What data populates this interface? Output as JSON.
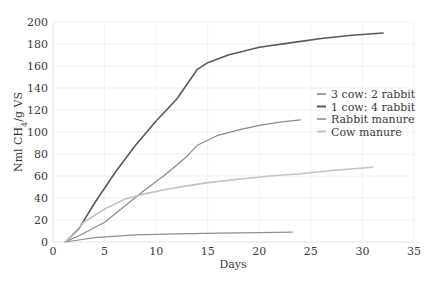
{
  "chart_data": {
    "type": "line",
    "title": "",
    "xlabel": "Days",
    "ylabel": "Nml CH4/g VS",
    "ylabel_parts": {
      "base": "Nml CH",
      "sub": "4",
      "rest": "/g VS"
    },
    "xlim": [
      0,
      35
    ],
    "ylim": [
      0,
      200
    ],
    "xticks": [
      0,
      5,
      10,
      15,
      20,
      25,
      30,
      35
    ],
    "yticks": [
      0,
      20,
      40,
      60,
      80,
      100,
      120,
      140,
      160,
      180,
      200
    ],
    "grid": true,
    "legend_position": "right-middle",
    "series": [
      {
        "name": "3 cow: 2 rabbit",
        "color": "#8a8a8a",
        "width": 1.2,
        "x": [
          1.2,
          3,
          5,
          7,
          9,
          11,
          13,
          14,
          16,
          18,
          20,
          22,
          24
        ],
        "y": [
          0,
          8,
          18,
          33,
          48,
          62,
          78,
          88,
          97,
          102,
          106,
          109,
          111
        ]
      },
      {
        "name": "1 cow: 4 rabbit",
        "color": "#5a5a5a",
        "width": 1.6,
        "x": [
          1.2,
          2.5,
          4,
          6,
          8,
          10,
          12,
          14,
          15,
          17,
          20,
          23,
          26,
          29,
          32
        ],
        "y": [
          0,
          12,
          35,
          63,
          88,
          110,
          130,
          157,
          163,
          170,
          177,
          181,
          185,
          188,
          190
        ]
      },
      {
        "name": "Rabbit manure",
        "color": "#8f8f8f",
        "width": 1.2,
        "x": [
          1.2,
          4,
          8,
          12,
          16,
          20,
          23.2
        ],
        "y": [
          0,
          4,
          6.5,
          7.5,
          8,
          8.5,
          9
        ]
      },
      {
        "name": "Cow manure",
        "color": "#c2c2c2",
        "width": 1.6,
        "x": [
          1.2,
          3,
          5,
          7,
          9,
          11,
          13,
          15,
          18,
          21,
          24,
          27,
          31
        ],
        "y": [
          0,
          18,
          30,
          39,
          44,
          48,
          51,
          54,
          57,
          60,
          62,
          65,
          68
        ]
      }
    ]
  }
}
